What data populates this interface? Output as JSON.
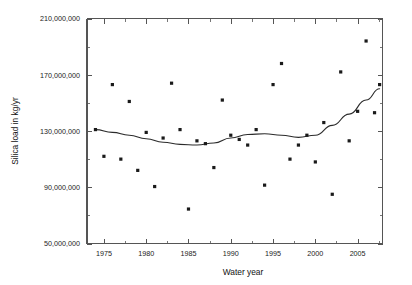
{
  "chart_data": {
    "type": "scatter",
    "title": "",
    "xlabel": "Water year",
    "ylabel": "Silica load in kg/yr",
    "xlim": [
      1973,
      2008
    ],
    "ylim": [
      50000000,
      210000000
    ],
    "grid": false,
    "legend": "none",
    "x_ticks_major": [
      1975,
      1980,
      1985,
      1990,
      1995,
      2000,
      2005
    ],
    "x_ticks_major_labels": [
      "1975",
      "1980",
      "1985",
      "1990",
      "1995",
      "2000",
      "2005"
    ],
    "x_ticks_minor": [
      1977.5,
      1982.5,
      1987.5,
      1992.5,
      1997.5,
      2002.5,
      2007.5
    ],
    "y_ticks_major": [
      50000000,
      90000000,
      130000000,
      170000000,
      210000000
    ],
    "y_ticks_major_labels": [
      "50,000,000",
      "90,000,000",
      "130,000,000",
      "170,000,000",
      "210,000,000"
    ],
    "y_ticks_minor": [
      70000000,
      110000000,
      150000000,
      190000000
    ],
    "series": [
      {
        "name": "Annual silica load",
        "type": "scatter",
        "marker": "square",
        "color": "#1a1a1a",
        "points": [
          {
            "x": 1974.0,
            "y": 131000000
          },
          {
            "x": 1975.0,
            "y": 112000000
          },
          {
            "x": 1976.0,
            "y": 163000000
          },
          {
            "x": 1977.0,
            "y": 110000000
          },
          {
            "x": 1978.0,
            "y": 151000000
          },
          {
            "x": 1979.0,
            "y": 102000000
          },
          {
            "x": 1980.0,
            "y": 129000000
          },
          {
            "x": 1981.0,
            "y": 90500000
          },
          {
            "x": 1982.0,
            "y": 125000000
          },
          {
            "x": 1983.0,
            "y": 164000000
          },
          {
            "x": 1984.0,
            "y": 131000000
          },
          {
            "x": 1985.0,
            "y": 74500000
          },
          {
            "x": 1986.0,
            "y": 123000000
          },
          {
            "x": 1987.0,
            "y": 121000000
          },
          {
            "x": 1988.0,
            "y": 104000000
          },
          {
            "x": 1989.0,
            "y": 152000000
          },
          {
            "x": 1990.0,
            "y": 127000000
          },
          {
            "x": 1991.0,
            "y": 124000000
          },
          {
            "x": 1992.0,
            "y": 120000000
          },
          {
            "x": 1993.0,
            "y": 131000000
          },
          {
            "x": 1994.0,
            "y": 91500000
          },
          {
            "x": 1995.0,
            "y": 163000000
          },
          {
            "x": 1996.0,
            "y": 178000000
          },
          {
            "x": 1997.0,
            "y": 110000000
          },
          {
            "x": 1998.0,
            "y": 120000000
          },
          {
            "x": 1999.0,
            "y": 127000000
          },
          {
            "x": 2000.0,
            "y": 108000000
          },
          {
            "x": 2001.0,
            "y": 136000000
          },
          {
            "x": 2002.0,
            "y": 85000000
          },
          {
            "x": 2003.0,
            "y": 172000000
          },
          {
            "x": 2004.0,
            "y": 123000000
          },
          {
            "x": 2005.0,
            "y": 144000000
          },
          {
            "x": 2006.0,
            "y": 194000000
          },
          {
            "x": 2007.0,
            "y": 143000000
          },
          {
            "x": 2007.6,
            "y": 163000000
          }
        ]
      },
      {
        "name": "LOWESS smooth",
        "type": "line",
        "color": "#2b2b2b",
        "points": [
          {
            "x": 1974.0,
            "y": 131000000
          },
          {
            "x": 1976.0,
            "y": 129000000
          },
          {
            "x": 1978.0,
            "y": 127000000
          },
          {
            "x": 1980.0,
            "y": 124500000
          },
          {
            "x": 1982.0,
            "y": 122000000
          },
          {
            "x": 1984.0,
            "y": 120500000
          },
          {
            "x": 1986.0,
            "y": 120000000
          },
          {
            "x": 1988.0,
            "y": 121500000
          },
          {
            "x": 1990.0,
            "y": 125000000
          },
          {
            "x": 1992.0,
            "y": 127500000
          },
          {
            "x": 1994.0,
            "y": 128000000
          },
          {
            "x": 1996.0,
            "y": 127000000
          },
          {
            "x": 1998.0,
            "y": 125500000
          },
          {
            "x": 2000.0,
            "y": 127000000
          },
          {
            "x": 2002.0,
            "y": 134000000
          },
          {
            "x": 2004.0,
            "y": 142000000
          },
          {
            "x": 2006.0,
            "y": 152000000
          },
          {
            "x": 2007.6,
            "y": 160000000
          }
        ]
      }
    ]
  }
}
